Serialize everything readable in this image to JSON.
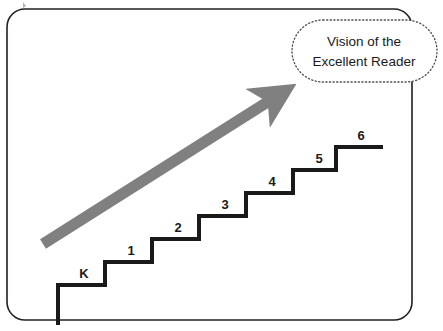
{
  "figure": {
    "background_color": "#ffffff",
    "frame": {
      "name": "rounded-rectangle-frame",
      "stroke_color": "#231f20",
      "x": 7,
      "y": 9,
      "width": 405,
      "height": 311,
      "corner_radius": 18
    },
    "callout": {
      "line1": "Vision of the",
      "line2": "Excellent Reader",
      "border_style": "dotted",
      "border_color": "#4d4d4d",
      "fill_color": "#ffffff",
      "x": 292,
      "y": 20,
      "width": 145,
      "height": 62,
      "corner_radius": 31
    },
    "arrow": {
      "name": "growth-arrow",
      "color": "#808080",
      "thickness": 11,
      "tail_x": 43,
      "tail_y": 244,
      "tip_x": 291,
      "tip_y": 87
    },
    "staircase": {
      "stroke_color": "#1a1a1a",
      "stroke_width": 4,
      "start_x": 58,
      "start_y": 325,
      "tread_run": 47,
      "riser_rise": 23,
      "base_y": 285,
      "steps": [
        {
          "label": "K",
          "label_x": 84,
          "label_y": 278
        },
        {
          "label": "1",
          "label_x": 131,
          "label_y": 255
        },
        {
          "label": "2",
          "label_x": 178,
          "label_y": 232
        },
        {
          "label": "3",
          "label_x": 225,
          "label_y": 209
        },
        {
          "label": "4",
          "label_x": 272,
          "label_y": 186
        },
        {
          "label": "5",
          "label_x": 319,
          "label_y": 163
        },
        {
          "label": "6",
          "label_x": 361,
          "label_y": 140
        }
      ]
    }
  }
}
